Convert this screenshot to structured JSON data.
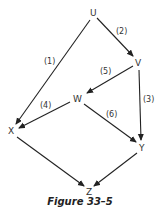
{
  "nodes": {
    "U": {
      "label": "U"
    },
    "V": {
      "label": "V"
    },
    "W": {
      "label": "W"
    },
    "X": {
      "label": "X"
    },
    "Y": {
      "label": "Y"
    },
    "Z": {
      "label": "Z"
    }
  },
  "edges": [
    {
      "from": "U",
      "to": "X",
      "label": "(1)"
    },
    {
      "from": "U",
      "to": "V",
      "label": "(2)"
    },
    {
      "from": "V",
      "to": "Y",
      "label": "(3)"
    },
    {
      "from": "W",
      "to": "X",
      "label": "(4)"
    },
    {
      "from": "V",
      "to": "W",
      "label": "(5)"
    },
    {
      "from": "W",
      "to": "Y",
      "label": "(6)"
    },
    {
      "from": "X",
      "to": "Z",
      "label": ""
    },
    {
      "from": "Y",
      "to": "Z",
      "label": ""
    }
  ],
  "edge_labels": {
    "e1": "(1)",
    "e2": "(2)",
    "e3": "(3)",
    "e4": "(4)",
    "e5": "(5)",
    "e6": "(6)"
  },
  "caption": "Figure 33–5"
}
